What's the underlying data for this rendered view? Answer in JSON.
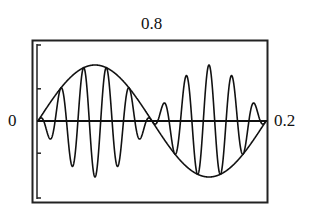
{
  "chart_data": {
    "type": "line",
    "title": "",
    "xlabel": "",
    "ylabel": "",
    "xlim": [
      0,
      0.2
    ],
    "ylim": [
      -0.8,
      0.8
    ],
    "grid": false,
    "legend": null,
    "tick_labels": {
      "x_min": "0",
      "x_max": "0.2",
      "y_max": "0.8"
    },
    "series": [
      {
        "name": "envelope",
        "description": "one full sine cycle over the x-range",
        "function": "0.8*sin(2*pi*x/0.2)",
        "x": [
          0,
          0.025,
          0.05,
          0.075,
          0.1,
          0.125,
          0.15,
          0.175,
          0.2
        ],
        "values": [
          0,
          0.57,
          0.8,
          0.57,
          0,
          -0.57,
          -0.8,
          -0.57,
          0
        ]
      },
      {
        "name": "modulated signal",
        "description": "high-frequency carrier multiplied by the envelope (about 10 carrier cycles across the range)",
        "function": "0.8*sin(2*pi*x/0.2)*cos(2*pi*50*x)",
        "carrier_cycles": 10
      }
    ],
    "colors": {
      "line": "#111111",
      "frame": "#222222",
      "background": "#ffffff"
    }
  },
  "labels": {
    "y_max": "0.8",
    "x_min": "0",
    "x_max": "0.2"
  }
}
